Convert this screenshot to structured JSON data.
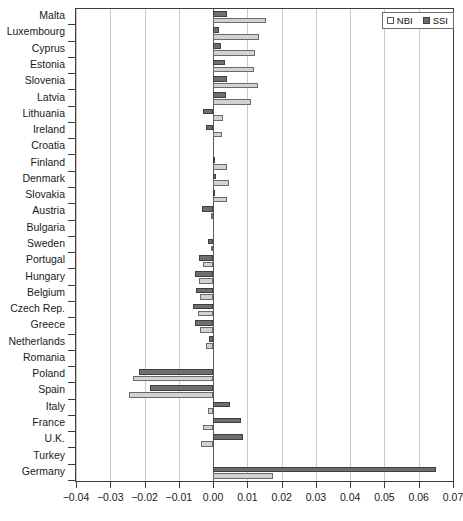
{
  "chart_data": {
    "type": "bar",
    "orientation": "horizontal",
    "title": "",
    "subtitle": "",
    "xlabel": "",
    "ylabel": "",
    "xlim": [
      -0.04,
      0.07
    ],
    "xticks": [
      -0.04,
      -0.03,
      -0.02,
      -0.01,
      0.0,
      0.01,
      0.02,
      0.03,
      0.04,
      0.05,
      0.06,
      0.07
    ],
    "xticklabels": [
      "−0.04",
      "−0.03",
      "−0.02",
      "−0.01",
      "0.00",
      "0.01",
      "0.02",
      "0.03",
      "0.04",
      "0.05",
      "0.06",
      "0.07"
    ],
    "grid": "vertical",
    "zero_reference_line": true,
    "legend_position": "top-right",
    "categories": [
      "Malta",
      "Luxembourg",
      "Cyprus",
      "Estonia",
      "Slovenia",
      "Latvia",
      "Lithuania",
      "Ireland",
      "Croatia",
      "Finland",
      "Denmark",
      "Slovakia",
      "Austria",
      "Bulgaria",
      "Sweden",
      "Portugal",
      "Hungary",
      "Belgium",
      "Czech Rep.",
      "Greece",
      "Netherlands",
      "Romania",
      "Poland",
      "Spain",
      "Italy",
      "France",
      "U.K.",
      "Turkey",
      "Germany"
    ],
    "series": [
      {
        "name": "SSI",
        "color": "#6e6e6e",
        "values": [
          0.004,
          0.0016,
          0.0022,
          0.0035,
          0.0042,
          0.0038,
          -0.003,
          -0.0022,
          0.0,
          0.0002,
          0.0008,
          0.0006,
          -0.0032,
          0.0,
          -0.0016,
          -0.0042,
          -0.0052,
          -0.005,
          -0.006,
          -0.0052,
          -0.0012,
          0.0,
          -0.0215,
          -0.0185,
          0.0048,
          0.0082,
          0.0088,
          0.0,
          0.065
        ]
      },
      {
        "name": "NBI",
        "color": "#d2d2d2",
        "values": [
          0.0155,
          0.0135,
          0.0122,
          0.0118,
          0.013,
          0.0112,
          0.003,
          0.0026,
          0.0,
          0.004,
          0.0045,
          0.0042,
          -0.0006,
          0.0,
          -0.0006,
          -0.003,
          -0.004,
          -0.0038,
          -0.0045,
          -0.0038,
          -0.0022,
          0.0,
          -0.0235,
          -0.0245,
          -0.0016,
          -0.003,
          -0.0035,
          0.0,
          0.0175
        ]
      }
    ]
  }
}
